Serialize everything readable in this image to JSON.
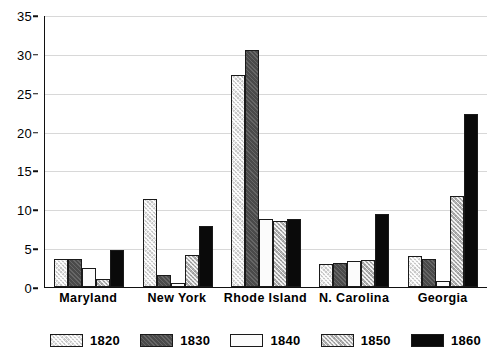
{
  "chart_data": {
    "type": "bar",
    "title": "",
    "subtitle": "",
    "xlabel": "",
    "ylabel": "",
    "ylim": [
      0,
      35
    ],
    "ytick_step": 5,
    "yticks": [
      0,
      5,
      10,
      15,
      20,
      25,
      30,
      35
    ],
    "grid": true,
    "legend_position": "bottom",
    "categories": [
      "Maryland",
      "New York",
      "Rhode Island",
      "N. Carolina",
      "Georgia"
    ],
    "series": [
      {
        "name": "1820",
        "pattern": "light-hatch",
        "color": "#c9c9c9",
        "values": [
          3.6,
          11.3,
          27.3,
          2.9,
          4.0
        ]
      },
      {
        "name": "1830",
        "pattern": "dark-solid",
        "color": "#4a4a4a",
        "values": [
          3.6,
          1.6,
          30.5,
          3.1,
          3.6
        ]
      },
      {
        "name": "1840",
        "pattern": "white",
        "color": "#fbfbfb",
        "values": [
          2.4,
          0.5,
          8.7,
          3.3,
          0.8
        ]
      },
      {
        "name": "1850",
        "pattern": "gray-hatch",
        "color": "#b3b3b3",
        "values": [
          1.0,
          4.1,
          8.5,
          3.5,
          11.7
        ]
      },
      {
        "name": "1860",
        "pattern": "black-solid",
        "color": "#0a0a0a",
        "values": [
          4.8,
          7.8,
          8.8,
          9.4,
          22.2
        ]
      }
    ]
  },
  "legend": {
    "items": [
      {
        "label": "1820"
      },
      {
        "label": "1830"
      },
      {
        "label": "1840"
      },
      {
        "label": "1850"
      },
      {
        "label": "1860"
      }
    ]
  }
}
